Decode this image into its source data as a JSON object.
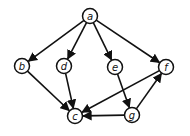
{
  "diagram": {
    "type": "directed-graph",
    "nodes": [
      {
        "id": "a",
        "label": "a",
        "x": 90,
        "y": 16
      },
      {
        "id": "b",
        "label": "b",
        "x": 22,
        "y": 66
      },
      {
        "id": "d",
        "label": "d",
        "x": 64,
        "y": 66
      },
      {
        "id": "e",
        "label": "e",
        "x": 115,
        "y": 67
      },
      {
        "id": "f",
        "label": "f",
        "x": 166,
        "y": 67
      },
      {
        "id": "c",
        "label": "c",
        "x": 75,
        "y": 116
      },
      {
        "id": "g",
        "label": "g",
        "x": 132,
        "y": 115
      }
    ],
    "edges": [
      {
        "from": "a",
        "to": "b"
      },
      {
        "from": "a",
        "to": "d"
      },
      {
        "from": "a",
        "to": "e"
      },
      {
        "from": "a",
        "to": "f"
      },
      {
        "from": "b",
        "to": "c"
      },
      {
        "from": "d",
        "to": "c"
      },
      {
        "from": "e",
        "to": "g"
      },
      {
        "from": "f",
        "to": "c"
      },
      {
        "from": "g",
        "to": "c"
      },
      {
        "from": "g",
        "to": "f"
      }
    ],
    "node_radius": 7.5,
    "colors": {
      "stroke": "#111111",
      "fill": "#ffffff"
    }
  }
}
